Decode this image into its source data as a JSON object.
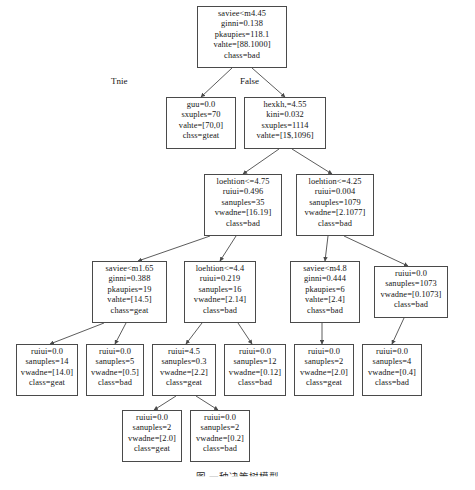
{
  "figure": {
    "caption": "图 一种决策树模型",
    "edge_labels": {
      "true": "Tnie",
      "false": "False"
    }
  },
  "nodes": [
    {
      "id": "root",
      "name": "node-root",
      "x": 197,
      "y": 6,
      "w": 90,
      "h": 62,
      "lines": [
        "saviee<m4.45",
        "ginni=0.138",
        "pkaupies=118.1",
        "vahte=[88.1000]",
        "chass=bad"
      ]
    },
    {
      "id": "l1-left",
      "name": "node-l1-left",
      "x": 166,
      "y": 97,
      "w": 70,
      "h": 52,
      "lines": [
        "guu=0.0",
        "sxuples=70",
        "vahte=[70,0]",
        "chss=gteat"
      ]
    },
    {
      "id": "l1-right",
      "name": "node-l1-right",
      "x": 244,
      "y": 97,
      "w": 82,
      "h": 52,
      "lines": [
        "hexkh,=4.55",
        "kini=0.032",
        "sxuples=1114",
        "vahte=[1$,1096]"
      ]
    },
    {
      "id": "l2-left",
      "name": "node-l2-left",
      "x": 204,
      "y": 174,
      "w": 78,
      "h": 62,
      "lines": [
        "loehtion<=4.75",
        "ruiui=0.496",
        "sanuples=35",
        "vwadne=[16.19]",
        "class=bad"
      ]
    },
    {
      "id": "l2-right",
      "name": "node-l2-right",
      "x": 296,
      "y": 174,
      "w": 78,
      "h": 62,
      "lines": [
        "loehtion<=4.25",
        "ruiui=0.004",
        "sanuples=1079",
        "vwadne=[2.1077]",
        "class=bad"
      ]
    },
    {
      "id": "l3-a",
      "name": "node-l3-saviee-m165",
      "x": 92,
      "y": 261,
      "w": 75,
      "h": 62,
      "lines": [
        "saviee<m1.65",
        "ginni=0.388",
        "pkaupies=19",
        "vahte=[14.5]",
        "chass=geat"
      ]
    },
    {
      "id": "l3-b",
      "name": "node-l3-loehtion-44",
      "x": 184,
      "y": 261,
      "w": 72,
      "h": 62,
      "lines": [
        "loehtion<=4.4",
        "ruiui=0.219",
        "sanuples=16",
        "vwadne=[2.14]",
        "class=bad"
      ]
    },
    {
      "id": "l3-c",
      "name": "node-l3-saviee-m48",
      "x": 290,
      "y": 261,
      "w": 70,
      "h": 62,
      "lines": [
        "saviee<m4.8",
        "ginni=0.444",
        "pkaupies=6",
        "vahte=[2.4]",
        "chass=bad"
      ]
    },
    {
      "id": "l3-d",
      "name": "node-l3-leaf-1073",
      "x": 374,
      "y": 266,
      "w": 74,
      "h": 52,
      "lines": [
        "ruiui=0.0",
        "sanuples=1073",
        "vwadne=[0.1073]",
        "class=bad"
      ]
    },
    {
      "id": "l4-a",
      "name": "node-leaf-14",
      "x": 16,
      "y": 344,
      "w": 62,
      "h": 52,
      "lines": [
        "ruiui=0.0",
        "sanuples=14",
        "vwadne=[14.0]",
        "class=geat"
      ]
    },
    {
      "id": "l4-b",
      "name": "node-leaf-5",
      "x": 86,
      "y": 344,
      "w": 58,
      "h": 52,
      "lines": [
        "ruiui=0.0",
        "sanuples=5",
        "vwadne=[0.5]",
        "class=bad"
      ]
    },
    {
      "id": "l4-c",
      "name": "node-leaf-03",
      "x": 152,
      "y": 344,
      "w": 64,
      "h": 52,
      "lines": [
        "ruiui=4.5",
        "sanuples=0.3",
        "vwadne=[2.2]",
        "class=geat"
      ]
    },
    {
      "id": "l4-d",
      "name": "node-leaf-12",
      "x": 224,
      "y": 344,
      "w": 62,
      "h": 52,
      "lines": [
        "ruiui=0.0",
        "sanuples=12",
        "vwadne=[0.12]",
        "class=bad"
      ]
    },
    {
      "id": "l4-e",
      "name": "node-leaf-2-geat",
      "x": 294,
      "y": 344,
      "w": 60,
      "h": 52,
      "lines": [
        "ruiui=0.0",
        "sanuples=2",
        "vwadne=[2.0]",
        "class=geat"
      ]
    },
    {
      "id": "l4-f",
      "name": "node-leaf-4-bad",
      "x": 362,
      "y": 344,
      "w": 60,
      "h": 52,
      "lines": [
        "ruiui=0.0",
        "sanuples=4",
        "vwadne=[0.4]",
        "class=bad"
      ]
    },
    {
      "id": "l5-a",
      "name": "node-leaf-2-geat-bottom",
      "x": 122,
      "y": 410,
      "w": 60,
      "h": 52,
      "lines": [
        "ruiui=0.0",
        "sanuples=2",
        "vwadne=[2.0]",
        "class=geat"
      ]
    },
    {
      "id": "l5-b",
      "name": "node-leaf-2-bad-bottom",
      "x": 190,
      "y": 410,
      "w": 60,
      "h": 52,
      "lines": [
        "ruiui=0.0",
        "sanuples=2",
        "vwadne=[0.2]",
        "class=bad"
      ]
    }
  ],
  "edges": [
    {
      "name": "edge-root-to-l1-left",
      "x1": 232,
      "y1": 68,
      "x2": 201,
      "y2": 97
    },
    {
      "name": "edge-root-to-l1-right",
      "x1": 252,
      "y1": 68,
      "x2": 285,
      "y2": 97
    },
    {
      "name": "edge-l1-right-to-l2-left",
      "x1": 279,
      "y1": 149,
      "x2": 243,
      "y2": 174
    },
    {
      "name": "edge-l1-right-to-l2-right",
      "x1": 292,
      "y1": 149,
      "x2": 332,
      "y2": 174
    },
    {
      "name": "edge-l2-left-to-l3-a",
      "x1": 210,
      "y1": 236,
      "x2": 138,
      "y2": 261
    },
    {
      "name": "edge-l2-left-to-l3-b",
      "x1": 236,
      "y1": 236,
      "x2": 220,
      "y2": 261
    },
    {
      "name": "edge-l2-right-to-l3-c",
      "x1": 328,
      "y1": 236,
      "x2": 325,
      "y2": 261
    },
    {
      "name": "edge-l2-right-to-l3-d",
      "x1": 344,
      "y1": 236,
      "x2": 408,
      "y2": 266
    },
    {
      "name": "edge-l3-a-to-l4-a",
      "x1": 104,
      "y1": 323,
      "x2": 50,
      "y2": 344
    },
    {
      "name": "edge-l3-a-to-l4-b",
      "x1": 126,
      "y1": 323,
      "x2": 115,
      "y2": 344
    },
    {
      "name": "edge-l3-b-to-l4-c",
      "x1": 202,
      "y1": 323,
      "x2": 186,
      "y2": 344
    },
    {
      "name": "edge-l3-b-to-l4-d",
      "x1": 238,
      "y1": 323,
      "x2": 252,
      "y2": 344
    },
    {
      "name": "edge-l3-c-to-l4-e",
      "x1": 322,
      "y1": 323,
      "x2": 322,
      "y2": 344
    },
    {
      "name": "edge-l3-d-to-l4-f",
      "x1": 404,
      "y1": 318,
      "x2": 392,
      "y2": 344
    },
    {
      "name": "edge-l4-c-to-l5-a",
      "x1": 176,
      "y1": 396,
      "x2": 154,
      "y2": 410
    },
    {
      "name": "edge-l4-c-to-l5-b",
      "x1": 196,
      "y1": 396,
      "x2": 218,
      "y2": 410
    }
  ]
}
